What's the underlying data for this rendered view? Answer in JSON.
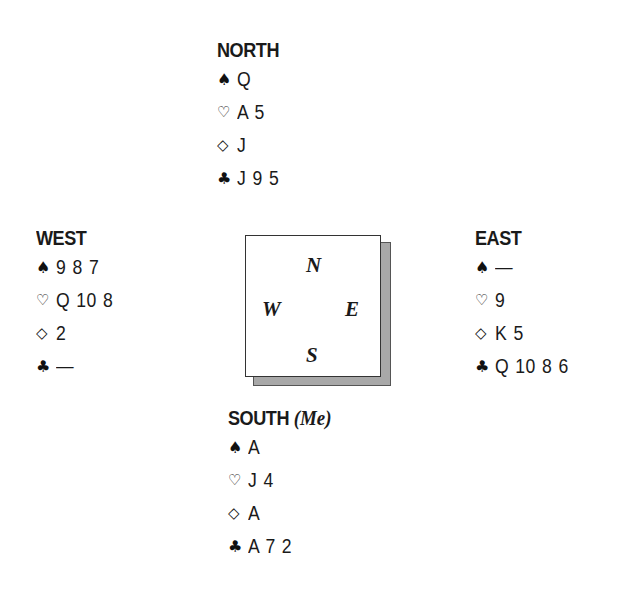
{
  "hands": {
    "north": {
      "title": "NORTH",
      "spades": "Q",
      "hearts": "A 5",
      "diamonds": "J",
      "clubs": "J 9 5"
    },
    "west": {
      "title": "WEST",
      "spades": "9 8 7",
      "hearts": "Q 10 8",
      "diamonds": "2",
      "clubs": "—"
    },
    "east": {
      "title": "EAST",
      "spades": "—",
      "hearts": "9",
      "diamonds": "K 5",
      "clubs": "Q 10 8 6"
    },
    "south": {
      "title": "SOUTH",
      "subtitle": "(Me)",
      "spades": "A",
      "hearts": "J 4",
      "diamonds": "A",
      "clubs": "A 7 2"
    }
  },
  "suits": {
    "spades": "♠",
    "hearts": "♡",
    "diamonds": "◇",
    "clubs": "♣"
  },
  "compass": {
    "north": "N",
    "west": "W",
    "east": "E",
    "south": "S"
  }
}
